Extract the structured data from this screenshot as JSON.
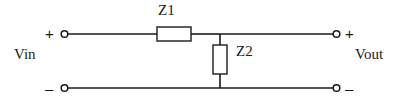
{
  "figure": {
    "name": "impedance-voltage-divider",
    "background_color": "#ffffff",
    "line_color": "#1a1a1a",
    "width": 407,
    "height": 100
  },
  "ports": {
    "input": {
      "label": "Vin",
      "positive_sign": "+",
      "negative_sign": "–"
    },
    "output": {
      "label": "Vout",
      "positive_sign": "+",
      "negative_sign": "–"
    }
  },
  "components": [
    {
      "id": "z1",
      "label": "Z1",
      "orientation": "horizontal",
      "role": "series-impedance"
    },
    {
      "id": "z2",
      "label": "Z2",
      "orientation": "vertical",
      "role": "shunt-impedance"
    }
  ]
}
